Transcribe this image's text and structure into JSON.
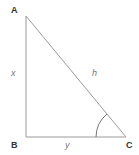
{
  "diagram": {
    "type": "right-triangle",
    "vertices": {
      "A": {
        "label": "A"
      },
      "B": {
        "label": "B"
      },
      "C": {
        "label": "C"
      }
    },
    "sides": {
      "AB": {
        "label": "x"
      },
      "BC": {
        "label": "y"
      },
      "AC": {
        "label": "h"
      }
    },
    "angle_marker": {
      "vertex": "C"
    },
    "colors": {
      "line": "#9a9a9a",
      "vertex_label": "#333333",
      "side_label": "#777777"
    }
  }
}
